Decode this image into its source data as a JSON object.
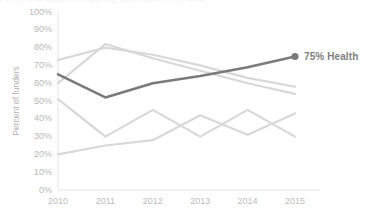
{
  "title_cut_off": "Percent of funders requiring open access by field",
  "chart_data": {
    "type": "line",
    "title": "",
    "xlabel": "",
    "ylabel": "Percent of funders",
    "x": [
      2010,
      2011,
      2012,
      2013,
      2014,
      2015
    ],
    "categories": [
      "2010",
      "2011",
      "2012",
      "2013",
      "2014",
      "2015"
    ],
    "xlim": [
      2010,
      2015
    ],
    "ylim": [
      0,
      100
    ],
    "ytick_labels": [
      "0%",
      "10%",
      "20%",
      "30%",
      "40%",
      "50%",
      "60%",
      "70%",
      "80%",
      "90%",
      "100%"
    ],
    "ytick_values": [
      0,
      10,
      20,
      30,
      40,
      50,
      60,
      70,
      80,
      90,
      100
    ],
    "grid": false,
    "legend_position": "right-end-of-line",
    "highlight_color": "#7a7a7a",
    "muted_color": "#d8d8d8",
    "axis_color": "#e4e4e4",
    "background": "#ffffff",
    "series": [
      {
        "name": "Health",
        "values": [
          65,
          52,
          60,
          64,
          69,
          75
        ],
        "highlight": true,
        "end_marker": true,
        "end_label": "75% Health"
      },
      {
        "name": "muted-upper-a",
        "values": [
          73,
          80,
          76,
          70,
          63,
          58
        ],
        "highlight": false
      },
      {
        "name": "muted-upper-b",
        "values": [
          60,
          82,
          74,
          67,
          60,
          54
        ],
        "highlight": false
      },
      {
        "name": "muted-lower-a",
        "values": [
          51,
          30,
          45,
          30,
          45,
          30
        ],
        "highlight": false
      },
      {
        "name": "muted-lower-b",
        "values": [
          20,
          25,
          28,
          42,
          31,
          43
        ],
        "highlight": false
      }
    ],
    "annotations": [
      {
        "text": "75% Health",
        "x": 2015,
        "y": 75
      }
    ]
  }
}
